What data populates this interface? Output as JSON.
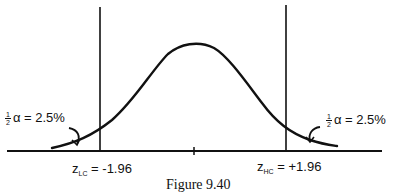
{
  "figure": {
    "caption": "Figure 9.40",
    "distribution": "standard normal curve",
    "left_tail": {
      "fraction_num": "1",
      "fraction_den": "2",
      "symbol": "α",
      "equals": "=",
      "value": "2.5%"
    },
    "right_tail": {
      "fraction_num": "1",
      "fraction_den": "2",
      "symbol": "α",
      "equals": "=",
      "value": "2.5%"
    },
    "lower_critical": {
      "var": "z",
      "subscript": "LC",
      "equals": "=",
      "value": "-1.96"
    },
    "upper_critical": {
      "var": "z",
      "subscript": "HC",
      "equals": "=",
      "value": "+1.96"
    }
  }
}
